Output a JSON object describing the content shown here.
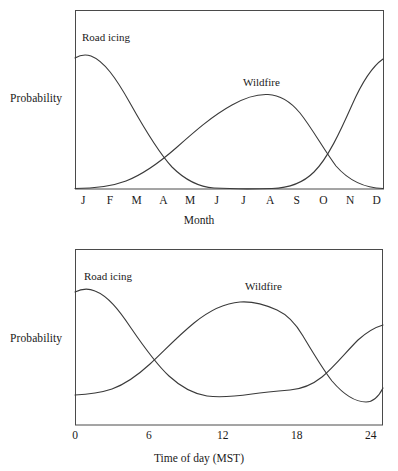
{
  "figure": {
    "background": "#ffffff",
    "line_color": "#3a3a3a",
    "axis_color": "#4a4a4a"
  },
  "panels": [
    {
      "id": "monthly",
      "ylabel": "Probability",
      "xlabel": "Month",
      "series_labels": {
        "road_icing": "Road icing",
        "wildfire": "Wildfire"
      },
      "ticks": [
        "J",
        "F",
        "M",
        "A",
        "M",
        "J",
        "J",
        "A",
        "S",
        "O",
        "N",
        "D"
      ]
    },
    {
      "id": "diurnal",
      "ylabel": "Probability",
      "xlabel": "Time of day (MST)",
      "series_labels": {
        "road_icing": "Road icing",
        "wildfire": "Wildfire"
      },
      "ticks": [
        "0",
        "6",
        "12",
        "18",
        "24"
      ]
    }
  ],
  "chart_data": [
    {
      "type": "line",
      "id": "monthly",
      "title": "",
      "xlabel": "Month",
      "ylabel": "Probability",
      "categories": [
        "J",
        "F",
        "M",
        "A",
        "M",
        "J",
        "J",
        "A",
        "S",
        "O",
        "N",
        "D"
      ],
      "x": [
        1,
        2,
        3,
        4,
        5,
        6,
        7,
        8,
        9,
        10,
        11,
        12
      ],
      "xlim": [
        0.5,
        12.5
      ],
      "ylim": [
        0,
        1
      ],
      "grid": false,
      "legend": "inline-annotations",
      "axis_ticks_numeric": false,
      "series": [
        {
          "name": "Road icing",
          "values": [
            0.98,
            0.93,
            0.74,
            0.5,
            0.29,
            0.14,
            0.05,
            0.01,
            0.03,
            0.16,
            0.48,
            0.99
          ]
        },
        {
          "name": "Wildfire",
          "values": [
            0.01,
            0.02,
            0.05,
            0.13,
            0.3,
            0.52,
            0.7,
            0.74,
            0.57,
            0.28,
            0.08,
            0.01
          ]
        }
      ],
      "annotations": [
        {
          "text": "Road icing",
          "x": 1.4,
          "y": 1.08
        },
        {
          "text": "Wildfire",
          "x": 7.8,
          "y": 0.84
        }
      ]
    },
    {
      "type": "line",
      "id": "diurnal",
      "title": "",
      "xlabel": "Time of day (MST)",
      "ylabel": "Probability",
      "x": [
        0,
        3,
        6,
        9,
        12,
        15,
        18,
        21,
        24
      ],
      "xlim": [
        0,
        25
      ],
      "ylim": [
        0,
        1
      ],
      "grid": false,
      "legend": "inline-annotations",
      "axis_ticks_numeric": true,
      "tick_values": [
        0,
        6,
        12,
        18,
        24
      ],
      "series": [
        {
          "name": "Road icing",
          "values": [
            0.83,
            0.8,
            0.65,
            0.44,
            0.3,
            0.24,
            0.25,
            0.36,
            0.62
          ]
        },
        {
          "name": "Wildfire",
          "values": [
            0.12,
            0.14,
            0.22,
            0.45,
            0.72,
            0.88,
            0.74,
            0.4,
            0.16
          ]
        }
      ],
      "annotations": [
        {
          "text": "Road icing",
          "x": 1.1,
          "y": 1.02
        },
        {
          "text": "Wildfire",
          "x": 13.0,
          "y": 0.99
        }
      ]
    }
  ]
}
